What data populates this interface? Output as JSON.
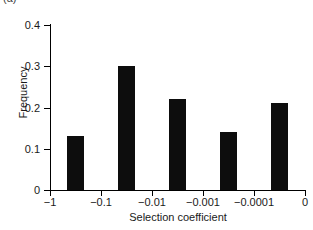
{
  "panel": {
    "label": "(a)"
  },
  "chart_data": {
    "type": "bar",
    "title": "",
    "xlabel": "Selection coefficient",
    "ylabel": "Frequency",
    "categories": [
      "-1 to -0.1",
      "-0.1 to -0.01",
      "-0.01 to -0.001",
      "-0.001 to -0.0001",
      "-0.0001 to 0"
    ],
    "values": [
      0.13,
      0.3,
      0.22,
      0.14,
      0.21
    ],
    "xtick_labels": [
      "−1",
      "−0.1",
      "−0.01",
      "−0.001",
      "−0.0001",
      "0"
    ],
    "ytick_labels": [
      "0",
      "0.1",
      "0.2",
      "0.3",
      "0.4"
    ],
    "ytick_values": [
      0,
      0.1,
      0.2,
      0.3,
      0.4
    ],
    "ylim": [
      0,
      0.4
    ],
    "xscale": "log-decade-bins",
    "grid": false,
    "legend": "none",
    "bar_color": "#0d0d0d",
    "bars": [
      {
        "label": "-1 to -0.1",
        "value": 0.13,
        "x_frac": 0.1,
        "width_frac": 0.068
      },
      {
        "label": "-0.1 to -0.01",
        "value": 0.3,
        "x_frac": 0.3,
        "width_frac": 0.068
      },
      {
        "label": "-0.01 to -0.001",
        "value": 0.22,
        "x_frac": 0.5,
        "width_frac": 0.068
      },
      {
        "label": "-0.001 to -0.0001",
        "value": 0.14,
        "x_frac": 0.7,
        "width_frac": 0.068
      },
      {
        "label": "-0.0001 to 0",
        "value": 0.21,
        "x_frac": 0.9,
        "width_frac": 0.068
      }
    ]
  }
}
